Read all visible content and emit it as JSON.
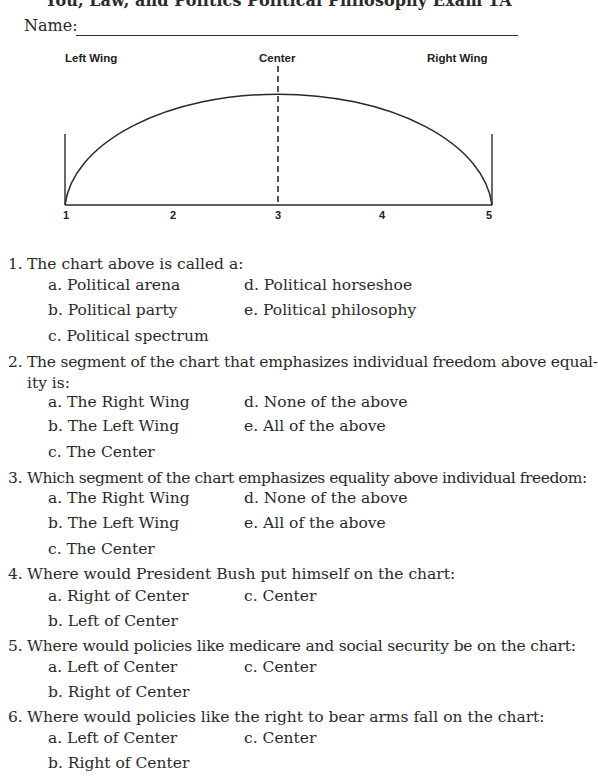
{
  "header": {
    "title": "You, Law, and Politics Political Philosophy Exam 1A",
    "name_label": "Name:"
  },
  "diagram": {
    "labels": {
      "left": "Left Wing",
      "center": "Center",
      "right": "Right Wing"
    },
    "ticks": [
      "1",
      "2",
      "3",
      "4",
      "5"
    ]
  },
  "questions": [
    {
      "number": "1.",
      "text": "The chart above is called a:",
      "options": {
        "a": "a. Political arena",
        "b": "b. Political party",
        "c": "c. Political spectrum",
        "d": "d. Political horseshoe",
        "e": "e. Political philosophy"
      }
    },
    {
      "number": "2.",
      "text": "The segment of the chart that emphasizes individual freedom above equal-",
      "text_cont": "ity is:",
      "options": {
        "a": "a. The Right Wing",
        "b": "b. The Left Wing",
        "c": "c. The Center",
        "d": "d. None of the above",
        "e": "e. All of the above"
      }
    },
    {
      "number": "3.",
      "text": "Which segment of the chart emphasizes equality above individual freedom:",
      "options": {
        "a": "a. The Right Wing",
        "b": "b. The Left Wing",
        "c": "c. The Center",
        "d": "d. None of the above",
        "e": "e. All of the above"
      }
    },
    {
      "number": "4.",
      "text": "Where would President Bush put himself on the chart:",
      "options": {
        "a": "a. Right of Center",
        "b": "b. Left of Center",
        "c": "c. Center"
      }
    },
    {
      "number": "5.",
      "text": "Where would policies like medicare and social security be on the chart:",
      "options": {
        "a": "a. Left of Center",
        "b": "b. Right of Center",
        "c": "c. Center"
      }
    },
    {
      "number": "6.",
      "text": "Where would policies like the right to bear arms fall on the chart:",
      "options": {
        "a": "a. Left of Center",
        "b": "b. Right of Center",
        "c": "c. Center"
      }
    }
  ]
}
